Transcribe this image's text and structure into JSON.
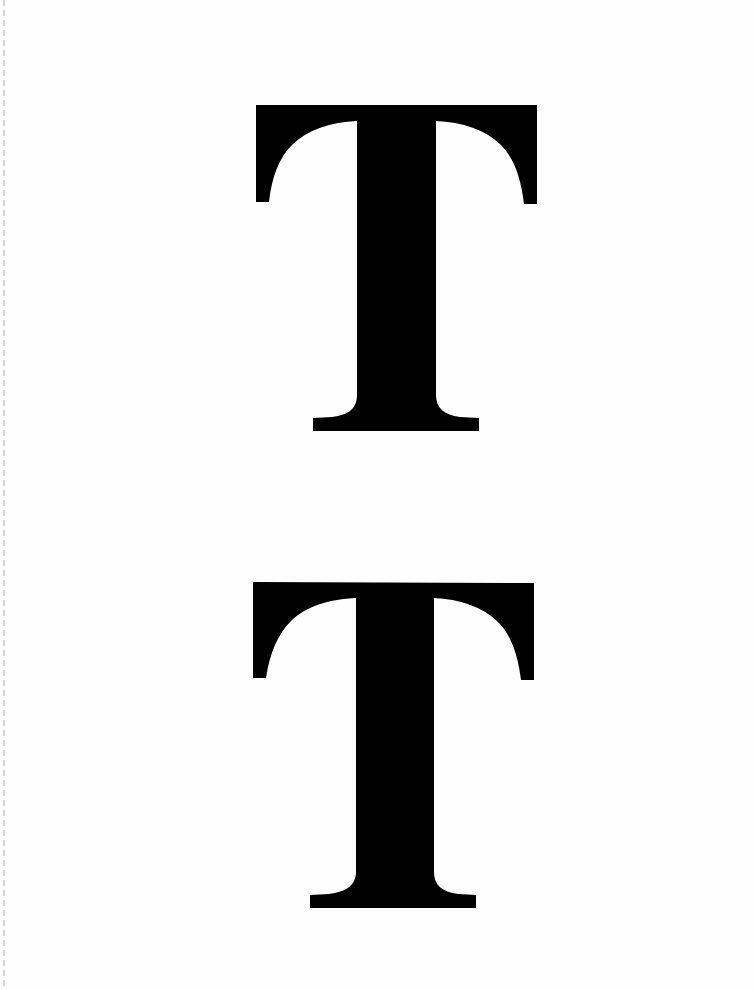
{
  "document": {
    "type": "scanned-page",
    "background_color": "#ffffff",
    "ink_color": "#000000",
    "glyphs": [
      {
        "char": "T",
        "position": "top",
        "bbox": {
          "x": 256,
          "y": 105,
          "width": 281,
          "height": 326
        }
      },
      {
        "char": "T",
        "position": "bottom",
        "bbox": {
          "x": 253,
          "y": 582,
          "width": 281,
          "height": 326
        }
      }
    ]
  }
}
